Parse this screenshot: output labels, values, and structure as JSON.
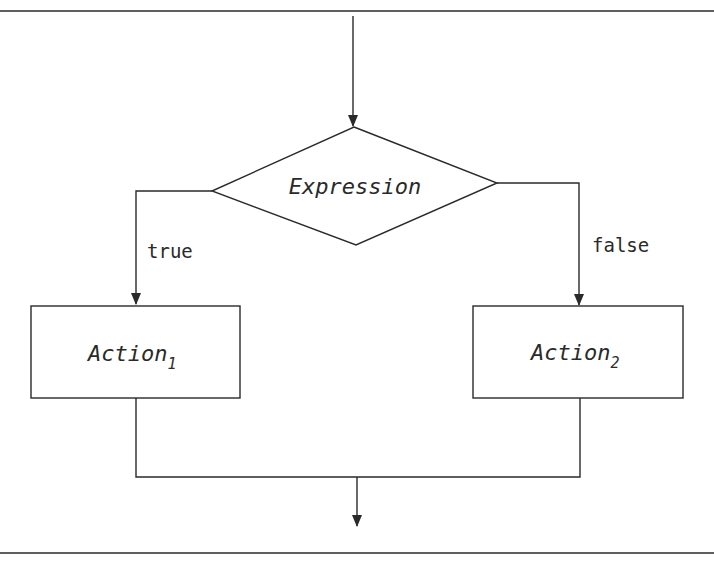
{
  "diagram": {
    "type": "flowchart-if-else",
    "colors": {
      "line": "#2a2a2a",
      "text": "#2a2a2a",
      "background": "#ffffff"
    },
    "decision": {
      "label": "Expression"
    },
    "branches": {
      "true": {
        "label": "true"
      },
      "false": {
        "label": "false"
      }
    },
    "actions": [
      {
        "name": "Action",
        "subscript": "1"
      },
      {
        "name": "Action",
        "subscript": "2"
      }
    ]
  }
}
